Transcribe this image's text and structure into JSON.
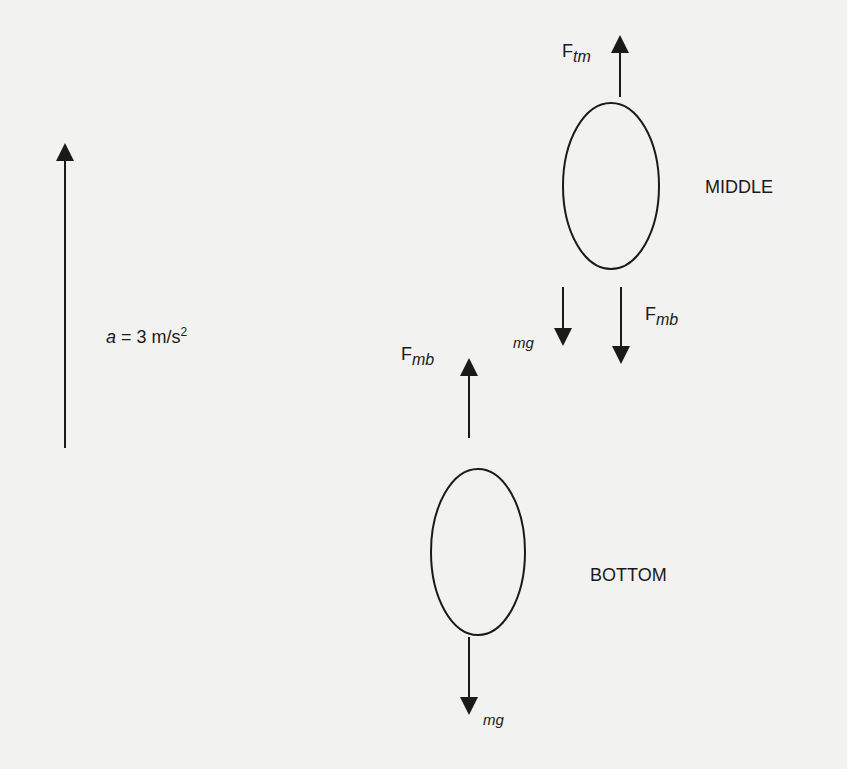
{
  "diagram": {
    "type": "free-body diagram",
    "colors": {
      "background": "#f2f2f0",
      "ink": "#1a1a1a"
    },
    "acceleration": {
      "symbol": "a",
      "equals": " = 3 m/s",
      "exponent": "2",
      "direction": "up"
    },
    "middle": {
      "label": "MIDDLE",
      "forces": [
        {
          "base": "F",
          "subscript": "tm",
          "direction": "up"
        },
        {
          "base": "",
          "subscript": "mg",
          "direction": "down"
        },
        {
          "base": "F",
          "subscript": "mb",
          "direction": "down"
        }
      ]
    },
    "bottom": {
      "label": "BOTTOM",
      "forces": [
        {
          "base": "F",
          "subscript": "mb",
          "direction": "up"
        },
        {
          "base": "",
          "subscript": "mg",
          "direction": "down"
        }
      ]
    }
  }
}
